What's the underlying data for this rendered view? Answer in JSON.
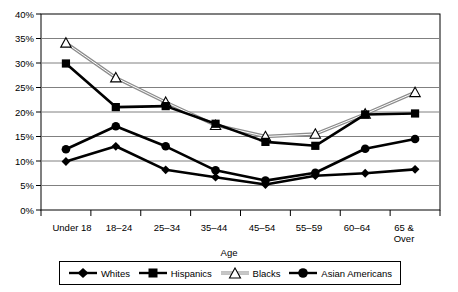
{
  "chart_data": {
    "type": "line",
    "title": "",
    "xlabel": "Age",
    "ylabel": "",
    "ylim": [
      0,
      40
    ],
    "ytick_step": 5,
    "ytick_labels": [
      "0%",
      "5%",
      "10%",
      "15%",
      "20%",
      "25%",
      "30%",
      "35%",
      "40%"
    ],
    "ytick_values": [
      0,
      5,
      10,
      15,
      20,
      25,
      30,
      35,
      40
    ],
    "grid": true,
    "legend_position": "bottom",
    "categories": [
      "Under 18",
      "18–24",
      "25–34",
      "35–44",
      "45–54",
      "55–59",
      "60–64",
      "65 & Over"
    ],
    "series": [
      {
        "name": "Whites",
        "marker": "diamond",
        "color": "#000000",
        "values": [
          9.9,
          13.0,
          8.2,
          6.7,
          5.2,
          7.0,
          7.5,
          8.3
        ]
      },
      {
        "name": "Hispanics",
        "marker": "square",
        "color": "#000000",
        "values": [
          29.9,
          21.0,
          21.2,
          17.6,
          13.9,
          13.1,
          19.5,
          19.7
        ]
      },
      {
        "name": "Blacks",
        "marker": "triangle",
        "color": "#999999",
        "values": [
          34.1,
          27.0,
          22.0,
          17.3,
          15.0,
          15.5,
          19.6,
          24.0
        ]
      },
      {
        "name": "Asian Americans",
        "marker": "circle",
        "color": "#000000",
        "values": [
          12.4,
          17.1,
          13.0,
          8.1,
          6.0,
          7.6,
          12.5,
          14.5
        ]
      }
    ]
  },
  "axis": {
    "x_title": "Age",
    "x_labels_multiline": {
      "7": [
        "65 &",
        "Over"
      ]
    }
  },
  "legend": {
    "entries": [
      {
        "label": "Whites",
        "icon": "diamond-marker-icon"
      },
      {
        "label": "Hispanics",
        "icon": "square-marker-icon"
      },
      {
        "label": "Blacks",
        "icon": "triangle-marker-icon"
      },
      {
        "label": "Asian Americans",
        "icon": "circle-marker-icon"
      }
    ]
  }
}
